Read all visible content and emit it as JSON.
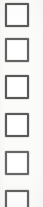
{
  "document": {
    "type": "scanned-checkbox-column",
    "background_color": "#fbfbfa",
    "width": 43,
    "height": 207
  },
  "checkbox_list": {
    "name": "checkbox-column",
    "count": 6,
    "box_size": 24,
    "box_left": 5,
    "border_color": "#5e5e5e",
    "border_width": 2,
    "fill_color": "#ffffff",
    "items": [
      {
        "index": 1,
        "label": "",
        "checked": false,
        "top": 3,
        "clipped": false,
        "ink": "ink-a"
      },
      {
        "index": 2,
        "label": "",
        "checked": false,
        "top": 38,
        "clipped": false,
        "ink": "ink-b"
      },
      {
        "index": 3,
        "label": "",
        "checked": false,
        "top": 75,
        "clipped": false,
        "ink": "ink-c"
      },
      {
        "index": 4,
        "label": "",
        "checked": false,
        "top": 113,
        "clipped": false,
        "ink": "ink-a"
      },
      {
        "index": 5,
        "label": "",
        "checked": false,
        "top": 151,
        "clipped": false,
        "ink": "ink-d"
      },
      {
        "index": 6,
        "label": "",
        "checked": false,
        "top": 190,
        "clipped": true,
        "ink": "ink-b"
      }
    ]
  }
}
